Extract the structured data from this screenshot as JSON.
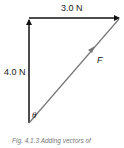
{
  "diagram": {
    "type": "vector-addition",
    "vectors": [
      {
        "name": "horizontal",
        "label": "3.0 N",
        "color": "#111111"
      },
      {
        "name": "vertical",
        "label": "4.0 N",
        "color": "#111111"
      },
      {
        "name": "resultant",
        "label": "F",
        "color": "#777777"
      }
    ],
    "angle_label": "θ",
    "caption": "Fig. 4.1.3 Adding vectors of"
  }
}
